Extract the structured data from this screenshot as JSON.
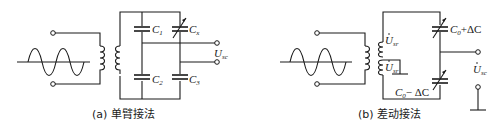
{
  "figure_a": {
    "caption": "(a) 单臂接法",
    "labels": {
      "c1": "C",
      "c1_sub": "1",
      "cx": "C",
      "cx_sub": "x",
      "c2": "C",
      "c2_sub": "2",
      "c3": "C",
      "c3_sub": "3",
      "output": "U",
      "output_sub": "sc"
    }
  },
  "figure_b": {
    "caption": "(b) 差动接法",
    "labels": {
      "cap_top": "C",
      "cap_top_sub": "0",
      "cap_top_suffix": "+ΔC",
      "cap_bottom": "C",
      "cap_bottom_sub": "0",
      "cap_bottom_suffix": "− ΔC",
      "coil_top": "U",
      "coil_top_sub": "sr",
      "coil_bottom": "U",
      "coil_bottom_sub": "sr",
      "output": "U",
      "output_sub": "sc"
    }
  },
  "colors": {
    "line": "#1a1a1a",
    "background": "#ffffff"
  }
}
